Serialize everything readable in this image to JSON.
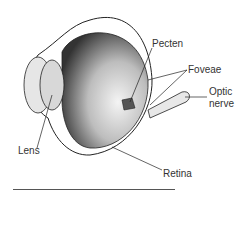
{
  "diagram": {
    "labels": {
      "pecten": "Pecten",
      "foveae": "Foveae",
      "optic_nerve_1": "Optic",
      "optic_nerve_2": "nerve",
      "lens": "Lens",
      "retina": "Retina"
    },
    "colors": {
      "ink": "#222222",
      "shade": "#cfcfcf",
      "background": "#ffffff"
    }
  }
}
